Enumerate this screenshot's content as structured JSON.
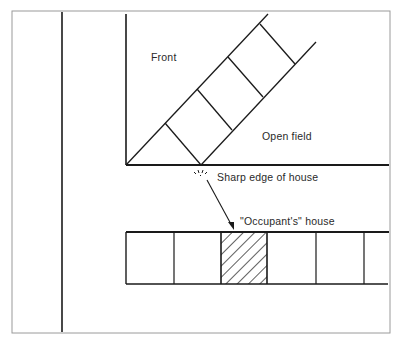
{
  "diagram": {
    "labels": {
      "front": "Front",
      "open_field": "Open field",
      "sharp_edge": "Sharp edge of house",
      "occupants_house": "\"Occupant's\" house"
    },
    "colors": {
      "ink": "#1a1a1a",
      "frame": "#9a9a9a",
      "background": "#ffffff"
    },
    "houses_row": {
      "count": 6,
      "hatched_index": 2
    }
  }
}
